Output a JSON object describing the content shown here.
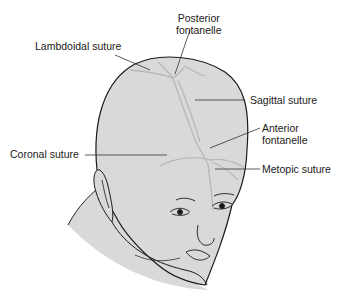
{
  "figure": {
    "labels": {
      "posterior_fontanelle": {
        "line1": "Posterior",
        "line2": "fontanelle"
      },
      "lambdoidal_suture": "Lambdoidal suture",
      "sagittal_suture": "Sagittal suture",
      "anterior_fontanelle": {
        "line1": "Anterior",
        "line2": "fontanelle"
      },
      "coronal_suture": "Coronal suture",
      "metopic_suture": "Metopic suture"
    },
    "colors": {
      "skin": "#d9d9d9",
      "outline": "#1a1a1a",
      "suture": "#b8b8b8",
      "leader": "#333333",
      "text": "#1a1a1a"
    }
  }
}
